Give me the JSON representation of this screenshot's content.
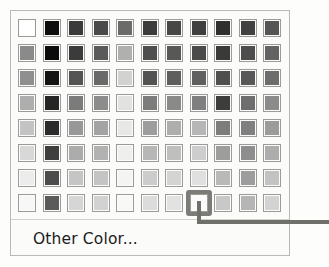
{
  "panel": {
    "name": "color-palette-dropdown",
    "background": "#fbfbfa",
    "border_color": "#b9bab6"
  },
  "grid": {
    "columns": 11,
    "rows": 8,
    "swatch_size_px": 18,
    "border_color": "#9b9c98",
    "rows_data": [
      {
        "row": 1,
        "colors": [
          "#ffffff",
          "#0d0d0d",
          "#3a3a3a",
          "#4a4a4a",
          "#6b6b6b",
          "#3c3c3c",
          "#474747",
          "#3f3f3f",
          "#2f2f2f",
          "#414141",
          "#555555"
        ]
      },
      {
        "row": 2,
        "colors": [
          "#8a8a8a",
          "#0b0b0b",
          "#3b3b3b",
          "#5a5a5a",
          "#b0b0b0",
          "#4e4e4e",
          "#585858",
          "#4a4a4a",
          "#3a3a3a",
          "#4d4d4d",
          "#636363"
        ]
      },
      {
        "row": 3,
        "colors": [
          "#8f8f8f",
          "#141414",
          "#545454",
          "#6a6a6a",
          "#d2d2d2",
          "#535353",
          "#5e5e5e",
          "#606060",
          "#4f4f4f",
          "#585858",
          "#6c6c6c"
        ]
      },
      {
        "row": 4,
        "colors": [
          "#aeaeae",
          "#252525",
          "#7b7b7b",
          "#8c8c8c",
          "#e2e2e2",
          "#7c7c7c",
          "#8a8a8a",
          "#7f7f7f",
          "#3d3d3d",
          "#6e6e6e",
          "#8b8b8b"
        ]
      },
      {
        "row": 5,
        "colors": [
          "#c3c3c3",
          "#2c2c2c",
          "#989898",
          "#a3a3a3",
          "#e8e8e8",
          "#9d9d9d",
          "#aeaeae",
          "#b6b6b6",
          "#7d7d7d",
          "#7f7f7f",
          "#9b9b9b"
        ]
      },
      {
        "row": 6,
        "colors": [
          "#d8d8d8",
          "#3e3e3e",
          "#acacac",
          "#b2b2b2",
          "#efefef",
          "#b7b7b7",
          "#bfbfbf",
          "#cdcdcd",
          "#9d9d9d",
          "#8e8e8e",
          "#adadad"
        ]
      },
      {
        "row": 7,
        "colors": [
          "#ececec",
          "#4c4c4c",
          "#c5c5c5",
          "#c4c4c4",
          "#f4f4f4",
          "#cccccc",
          "#d4d4d4",
          "#e0e0e0",
          "#b9b9b9",
          "#9d9d9d",
          "#c3c3c3"
        ]
      },
      {
        "row": 8,
        "colors": [
          "#f7f7f7",
          "#5a5a5a",
          "#d6d6d6",
          "#d2d2d2",
          "#f8f8f8",
          "#dcdcdc",
          "#e2e2e2",
          "#fbfbfb",
          "#c8c8c8",
          "#b5b5b5",
          "#d3d3d3"
        ]
      }
    ]
  },
  "selection": {
    "row": 8,
    "column": 8,
    "highlight_color": "#7b7c78"
  },
  "callout": {
    "line_color": "#6f706c"
  },
  "footer": {
    "other_color_label": "Other Color...",
    "separator_color": "#cfd0cc"
  }
}
